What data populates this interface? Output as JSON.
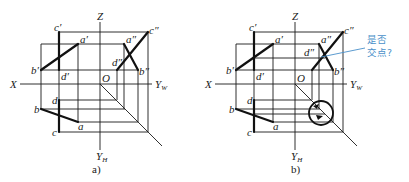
{
  "figure": {
    "colors": {
      "line": "#1a1a1a",
      "annotation": "#4a90c9"
    },
    "panels": [
      {
        "caption": "a)",
        "axes": {
          "z": "Z",
          "x": "X",
          "yw": "Y",
          "yw_sub": "W",
          "yh": "Y",
          "yh_sub": "H",
          "origin": "O"
        },
        "labels": {
          "c_front": "c′",
          "a_front": "a′",
          "b_front": "b′",
          "d_front": "d′",
          "c_side": "c″",
          "a_side": "a″",
          "b_side": "b″",
          "d_side": "d″",
          "d_top": "d",
          "b_top": "b",
          "a_top": "a",
          "c_top": "c"
        }
      },
      {
        "caption": "b)",
        "axes": {
          "z": "Z",
          "x": "X",
          "yw": "Y",
          "yw_sub": "W",
          "yh": "Y",
          "yh_sub": "H",
          "origin": "O"
        },
        "labels": {
          "c_front": "c′",
          "a_front": "a′",
          "b_front": "b′",
          "d_front": "d′",
          "c_side": "c″",
          "a_side": "a″",
          "b_side": "b″",
          "d_side": "d″",
          "d_top": "d",
          "b_top": "b",
          "a_top": "a",
          "c_top": "c"
        },
        "annotation": {
          "line1": "是否",
          "line2": "交点?"
        }
      }
    ]
  }
}
